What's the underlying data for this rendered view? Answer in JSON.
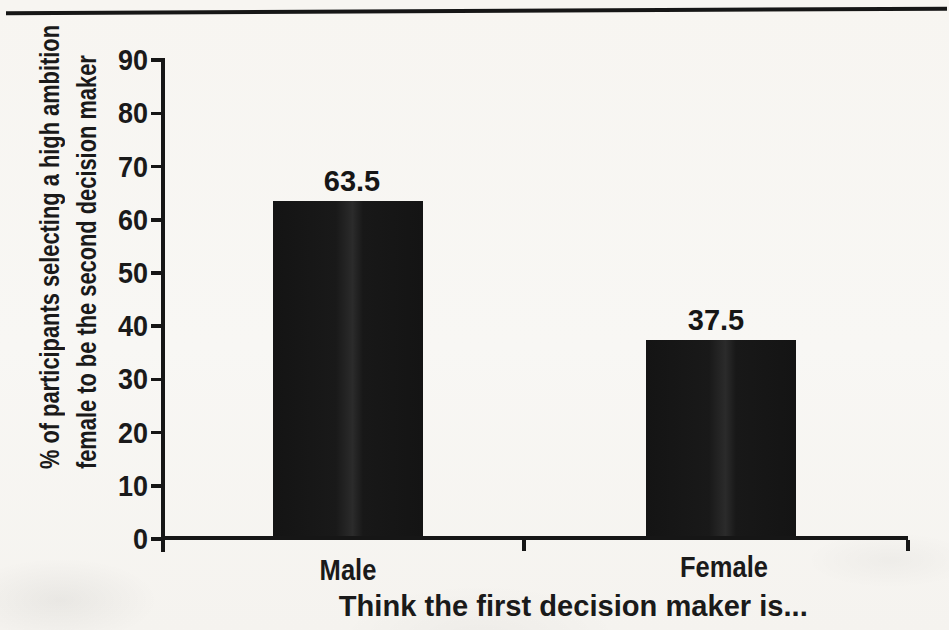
{
  "page": {
    "background": "#f7f5f1",
    "top_rule_color": "#161616"
  },
  "chart_data": {
    "type": "bar",
    "title": "",
    "categories": [
      "Male",
      "Female"
    ],
    "values": [
      63.5,
      37.5
    ],
    "value_labels": [
      "63.5",
      "37.5"
    ],
    "xlabel": "Think the first decision maker is...",
    "ylabel_lines": [
      "% of participants selecting a high ambition",
      "female to be the second decision maker"
    ],
    "ylim": [
      0,
      90
    ],
    "yticks": [
      0,
      10,
      20,
      30,
      40,
      50,
      60,
      70,
      80,
      90
    ],
    "grid": false,
    "legend": null,
    "bar_color": "#141414",
    "axis_color": "#161616",
    "text_color": "#1a1a1a"
  }
}
